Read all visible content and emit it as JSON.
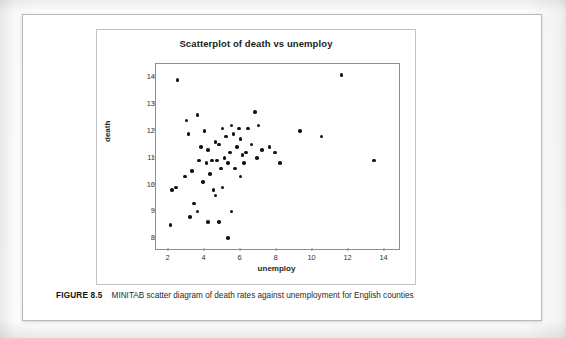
{
  "figure": {
    "number_label": "FIGURE 8.5",
    "caption": "MINITAB scatter diagram of death rates against unemployment for English counties"
  },
  "chart_data": {
    "type": "scatter",
    "title": "Scatterplot of death vs unemploy",
    "xlabel": "unemploy",
    "ylabel": "death",
    "xlim": [
      1.3,
      14.8
    ],
    "ylim": [
      7.6,
      14.5
    ],
    "xticks": [
      2,
      4,
      6,
      8,
      10,
      12,
      14
    ],
    "yticks": [
      8,
      9,
      10,
      11,
      12,
      13,
      14
    ],
    "grid": false,
    "legend": null,
    "marker": "filled-circle",
    "marker_color": "#111111",
    "points": [
      [
        2.5,
        13.9
      ],
      [
        2.2,
        9.8
      ],
      [
        2.4,
        9.9
      ],
      [
        2.1,
        8.5
      ],
      [
        3.0,
        12.4
      ],
      [
        3.6,
        12.6
      ],
      [
        3.1,
        11.9
      ],
      [
        3.3,
        10.5
      ],
      [
        2.9,
        10.3
      ],
      [
        3.4,
        9.3
      ],
      [
        3.2,
        8.8
      ],
      [
        3.8,
        11.4
      ],
      [
        3.7,
        10.9
      ],
      [
        3.9,
        10.1
      ],
      [
        3.6,
        9.0
      ],
      [
        4.0,
        12.0
      ],
      [
        4.2,
        11.3
      ],
      [
        4.1,
        10.8
      ],
      [
        4.4,
        10.9
      ],
      [
        4.3,
        10.4
      ],
      [
        4.5,
        9.8
      ],
      [
        4.2,
        8.6
      ],
      [
        4.6,
        11.6
      ],
      [
        4.8,
        11.5
      ],
      [
        4.7,
        10.9
      ],
      [
        4.9,
        10.6
      ],
      [
        4.6,
        9.6
      ],
      [
        4.8,
        8.6
      ],
      [
        5.0,
        12.1
      ],
      [
        5.2,
        11.8
      ],
      [
        5.1,
        11.0
      ],
      [
        5.3,
        10.8
      ],
      [
        5.0,
        9.9
      ],
      [
        5.3,
        8.0
      ],
      [
        5.5,
        12.2
      ],
      [
        5.6,
        11.9
      ],
      [
        5.4,
        11.2
      ],
      [
        5.7,
        10.6
      ],
      [
        5.5,
        9.0
      ],
      [
        5.9,
        12.1
      ],
      [
        6.0,
        11.7
      ],
      [
        5.8,
        11.4
      ],
      [
        6.1,
        11.1
      ],
      [
        6.2,
        10.8
      ],
      [
        6.0,
        10.3
      ],
      [
        6.4,
        12.1
      ],
      [
        6.6,
        11.5
      ],
      [
        6.3,
        11.2
      ],
      [
        6.8,
        12.7
      ],
      [
        7.0,
        12.2
      ],
      [
        6.9,
        11.0
      ],
      [
        7.2,
        11.3
      ],
      [
        7.6,
        11.4
      ],
      [
        7.9,
        11.2
      ],
      [
        8.2,
        10.8
      ],
      [
        9.3,
        12.0
      ],
      [
        10.5,
        11.8
      ],
      [
        11.6,
        14.1
      ],
      [
        13.4,
        10.9
      ]
    ]
  }
}
